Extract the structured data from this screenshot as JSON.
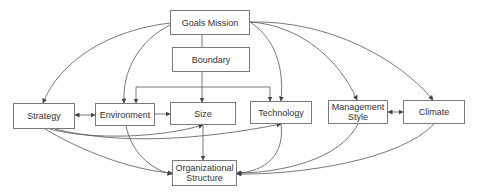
{
  "diagram": {
    "type": "organizational-design-factors",
    "nodes": [
      {
        "id": "goals_mission",
        "label": "Goals Mission"
      },
      {
        "id": "boundary",
        "label": "Boundary"
      },
      {
        "id": "strategy",
        "label": "Strategy"
      },
      {
        "id": "environment",
        "label": "Environment"
      },
      {
        "id": "size",
        "label": "Size"
      },
      {
        "id": "technology",
        "label": "Technology"
      },
      {
        "id": "management_style",
        "label": "Management Style",
        "lines": [
          "Management",
          "Style"
        ]
      },
      {
        "id": "climate",
        "label": "Climate"
      },
      {
        "id": "organizational_structure",
        "label": "Organizational Structure",
        "lines": [
          "Organizational",
          "Structure"
        ]
      }
    ],
    "edges": [
      {
        "from": "goals_mission",
        "to": "boundary",
        "style": "line"
      },
      {
        "from": "boundary",
        "to": "size",
        "style": "arrow"
      },
      {
        "from": "boundary",
        "to": "environment",
        "style": "arrow"
      },
      {
        "from": "boundary",
        "to": "technology",
        "style": "arrow"
      },
      {
        "from": "goals_mission",
        "to": "strategy",
        "style": "curved-arrow"
      },
      {
        "from": "goals_mission",
        "to": "environment",
        "style": "curved-arrow"
      },
      {
        "from": "goals_mission",
        "to": "technology",
        "style": "curved-arrow"
      },
      {
        "from": "goals_mission",
        "to": "management_style",
        "style": "curved-arrow"
      },
      {
        "from": "goals_mission",
        "to": "climate",
        "style": "curved-arrow"
      },
      {
        "from": "strategy",
        "to": "environment",
        "style": "bidirectional"
      },
      {
        "from": "environment",
        "to": "size",
        "style": "arrow"
      },
      {
        "from": "management_style",
        "to": "climate",
        "style": "bidirectional"
      },
      {
        "from": "strategy",
        "to": "size",
        "style": "curved-arrow"
      },
      {
        "from": "strategy",
        "to": "technology",
        "style": "curved-arrow"
      },
      {
        "from": "strategy",
        "to": "organizational_structure",
        "style": "curved-arrow"
      },
      {
        "from": "environment",
        "to": "organizational_structure",
        "style": "curved-arrow"
      },
      {
        "from": "size",
        "to": "organizational_structure",
        "style": "arrow"
      },
      {
        "from": "technology",
        "to": "organizational_structure",
        "style": "curved-arrow"
      },
      {
        "from": "management_style",
        "to": "organizational_structure",
        "style": "curved-arrow"
      },
      {
        "from": "climate",
        "to": "organizational_structure",
        "style": "curved-arrow"
      }
    ]
  },
  "colors": {
    "line": "#555555",
    "border": "#7a7a7a",
    "text": "#333333"
  }
}
